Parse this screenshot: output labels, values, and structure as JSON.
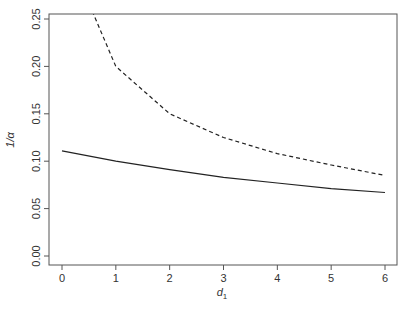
{
  "chart_data": {
    "type": "line",
    "title": "",
    "xlabel": "d1",
    "xlabel_main": "d",
    "xlabel_sub": "1",
    "ylabel": "1/α",
    "xlim": [
      -0.25,
      6.25
    ],
    "ylim": [
      -0.008,
      0.258
    ],
    "grid": false,
    "legend": null,
    "x_ticks": [
      0,
      1,
      2,
      3,
      4,
      5,
      6
    ],
    "x_tick_labels": [
      "0",
      "1",
      "2",
      "3",
      "4",
      "5",
      "6"
    ],
    "y_ticks": [
      0.0,
      0.05,
      0.1,
      0.15,
      0.2,
      0.25
    ],
    "y_tick_labels": [
      "0.00",
      "0.05",
      "0.10",
      "0.15",
      "0.20",
      "0.25"
    ],
    "x": [
      0,
      1,
      2,
      3,
      4,
      5,
      6
    ],
    "series": [
      {
        "name": "solid",
        "style": "solid",
        "color": "#222222",
        "values": [
          0.111,
          0.1,
          0.091,
          0.083,
          0.077,
          0.071,
          0.067
        ]
      },
      {
        "name": "dashed",
        "style": "dashed",
        "color": "#222222",
        "values": [
          0.333,
          0.2,
          0.15,
          0.125,
          0.108,
          0.096,
          0.085
        ]
      }
    ]
  }
}
